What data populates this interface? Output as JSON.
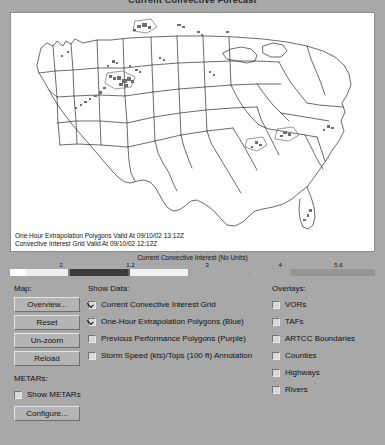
{
  "window": {
    "title": "Current Convective Forecast"
  },
  "map": {
    "annotations": [
      "One Hour Extrapolation Polygons Valid At 09/10/02 13:12Z",
      "Convective Interest Grid Valid At 09/10/02 12:12Z"
    ],
    "background_color": "#ffffff",
    "border_color": "#8d8d8d",
    "outline_color": "#2b2b2b",
    "feature_color": "#7a7a7a"
  },
  "colorbar": {
    "title": "Current Convective Interest (No Units)",
    "ticks": [
      {
        "label": "2",
        "pos": 14
      },
      {
        "label": "1.2",
        "pos": 33
      },
      {
        "label": "3",
        "pos": 54
      },
      {
        "label": "4",
        "pos": 74
      },
      {
        "label": "5.6",
        "pos": 90
      }
    ],
    "segments": [
      {
        "start": 0,
        "width": 16,
        "color": "#fdfdfd"
      },
      {
        "start": 16,
        "width": 42,
        "color": "#efefef"
      },
      {
        "start": 58,
        "width": 2,
        "color": "#7c7c7c"
      },
      {
        "start": 60,
        "width": 58,
        "color": "#3c3c3c"
      },
      {
        "start": 118,
        "width": 2,
        "color": "#686868"
      },
      {
        "start": 120,
        "width": 58,
        "color": "#f3f3f3"
      },
      {
        "start": 178,
        "width": 1,
        "color": "#9a9a9a"
      },
      {
        "start": 179,
        "width": 60,
        "color": "#a8a8a8"
      },
      {
        "start": 239,
        "width": 1,
        "color": "#9a9a9a"
      },
      {
        "start": 240,
        "width": 40,
        "color": "#a8a8a8"
      }
    ],
    "tail_bar": {
      "start": 240,
      "width": 125,
      "color": "#959595"
    }
  },
  "panel": {
    "map_section": {
      "label": "Map:",
      "buttons": [
        "Overview...",
        "Reset",
        "Un-zoom",
        "Reload"
      ]
    },
    "show_data": {
      "label": "Show Data:",
      "items": [
        {
          "label": "Current Convective Interest Grid",
          "checked": true
        },
        {
          "label": "One-Hour Extrapolation Polygons (Blue)",
          "checked": true
        },
        {
          "label": "Previous Performance Polygons (Purple)",
          "checked": false
        },
        {
          "label": "Storm Speed (kts)/Tops (100 ft) Annotation",
          "checked": false
        }
      ]
    },
    "overlays": {
      "label": "Overlays:",
      "items": [
        {
          "label": "VORs",
          "checked": false
        },
        {
          "label": "TAFs",
          "checked": false
        },
        {
          "label": "ARTCC Boundaries",
          "checked": false
        },
        {
          "label": "Counties",
          "checked": false
        },
        {
          "label": "Highways",
          "checked": false
        },
        {
          "label": "Rivers",
          "checked": false
        }
      ]
    },
    "metars": {
      "label": "METARs:",
      "checkbox": {
        "label": "Show METARs",
        "checked": false
      },
      "button": "Configure..."
    }
  },
  "colors": {
    "panel_bg": "#a8a8a8",
    "button_face": "#b4b4b4",
    "text": "#111111"
  }
}
